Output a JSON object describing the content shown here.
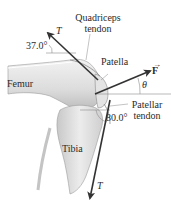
{
  "diagram": {
    "labels": {
      "quadriceps_tendon": [
        "Quadriceps",
        "tendon"
      ],
      "patella": "Patella",
      "femur": "Femur",
      "tibia": "Tibia",
      "patellar_tendon": [
        "Patellar",
        "tendon"
      ],
      "force": "F",
      "theta": "θ",
      "tension_upper": "T",
      "tension_lower": "T",
      "angle_upper": "37.0°",
      "angle_lower": "80.0°"
    },
    "colors": {
      "arrow": "#333333",
      "bone_fill": "#e6e6e6",
      "bone_shade": "#bdbdbd",
      "reference_line": "#8c8c8c"
    }
  }
}
